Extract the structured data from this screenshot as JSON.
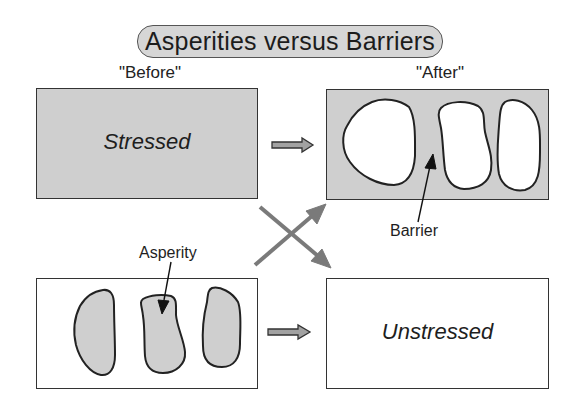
{
  "title": "Asperities versus Barriers",
  "phases": {
    "before": "\"Before\"",
    "after": "\"After\""
  },
  "boxes": {
    "before_top": {
      "label": "Stressed",
      "fill": "#cfcfcf"
    },
    "after_top": {
      "label": "",
      "fill": "#cfcfcf",
      "patches_fill": "#ffffff",
      "patch_count": 3
    },
    "before_bottom": {
      "label": "",
      "fill": "#ffffff",
      "patches_fill": "#cfcfcf",
      "patch_count": 3
    },
    "after_bottom": {
      "label": "Unstressed",
      "fill": "#ffffff"
    }
  },
  "callouts": {
    "barrier": "Barrier",
    "asperity": "Asperity"
  },
  "arrows": {
    "horizontal_color": "#9a9a9a",
    "cross_color": "#7a7a7a",
    "outline_color": "#333333"
  }
}
